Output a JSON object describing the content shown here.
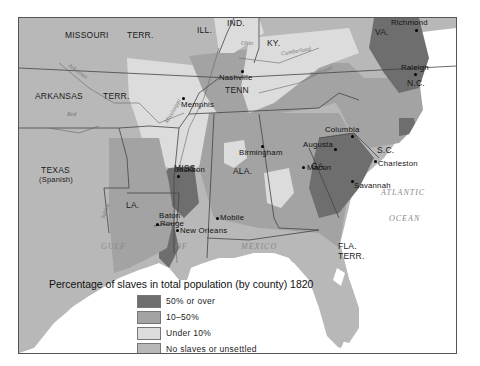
{
  "map": {
    "title": "Percentage of slaves in total population (by county) 1820",
    "colors": {
      "over_50": "#6e6e6e",
      "ten_to_50": "#a3a3a3",
      "under_10": "#dcdcdc",
      "no_slaves": "#b8b8b8",
      "water": "#ffffff",
      "border": "#555555"
    },
    "states": {
      "missouri": "MISSOURI",
      "missouri_terr": "TERR.",
      "ill": "ILL.",
      "ind": "IND.",
      "ky": "KY.",
      "va": "VA.",
      "arkansas": "ARKANSAS",
      "arkansas_terr": "TERR.",
      "tenn": "TENN",
      "nc": "N.C.",
      "sc": "S.C.",
      "miss": "MISS.",
      "ala": "ALA.",
      "ga": "GA.",
      "la": "LA.",
      "texas": "TEXAS",
      "texas_sub": "(Spanish)",
      "fla": "FLA.",
      "fla_terr": "TERR."
    },
    "cities": {
      "richmond": "Richmond",
      "raleigh": "Raleigh",
      "nashville": "Nashville",
      "memphis": "Memphis",
      "columbia": "Columbia",
      "augusta": "Augusta",
      "charleston": "Charleston",
      "macon": "Macon",
      "savannah": "Savannah",
      "birmingham": "Birmingham",
      "jackson": "Jackson",
      "baton_rouge_1": "Baton",
      "baton_rouge_2": "Rouge",
      "new_orleans": "New Orleans",
      "mobile": "Mobile"
    },
    "water": {
      "gulf": "GULF",
      "of": "OF",
      "mexico": "MEXICO",
      "atlantic": "ATLANTIC",
      "ocean": "OCEAN"
    },
    "rivers": {
      "arkansas": "Arkansas",
      "red": "Red",
      "mississippi": "Mississippi",
      "ohio": "Ohio",
      "cumberland": "Cumberland",
      "tennessee": "Tennessee",
      "sabine": "Sabine",
      "r": "R."
    }
  },
  "legend": {
    "items": [
      {
        "label": "50% or over",
        "color": "#6e6e6e"
      },
      {
        "label": "10–50%",
        "color": "#a3a3a3"
      },
      {
        "label": "Under 10%",
        "color": "#dcdcdc"
      },
      {
        "label": "No slaves or unsettled",
        "color": "#b8b8b8"
      }
    ]
  }
}
